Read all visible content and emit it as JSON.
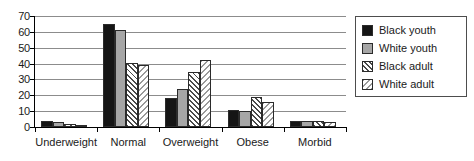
{
  "chart_data": {
    "type": "bar",
    "title": "",
    "subtitle": "",
    "xlabel": "",
    "ylabel": "",
    "categories": [
      "Underweight",
      "Normal",
      "Overweight",
      "Obese",
      "Morbid"
    ],
    "series": [
      {
        "name": "Black youth",
        "color": "#151515",
        "pattern": "solid",
        "values": [
          4,
          65,
          18,
          11,
          4
        ]
      },
      {
        "name": "White youth",
        "color": "#a6a6a6",
        "pattern": "solid",
        "values": [
          3,
          61,
          24,
          10,
          4
        ]
      },
      {
        "name": "Black adult",
        "color": "#4a4a4a",
        "pattern": "hatch-dark",
        "values": [
          2,
          40.5,
          35,
          19,
          4
        ]
      },
      {
        "name": "White adult",
        "color": "#9a9a9a",
        "pattern": "hatch-light",
        "values": [
          1.5,
          39,
          42,
          16,
          3
        ]
      }
    ],
    "ylim": [
      0,
      70
    ],
    "ytick_step": 10,
    "yticks": [
      0,
      10,
      20,
      30,
      40,
      50,
      60,
      70
    ],
    "ytick_labels": [
      "0",
      "10",
      "20",
      "30",
      "40",
      "50",
      "60",
      "70"
    ],
    "grid": true,
    "grid_axis": "y",
    "legend_position": "right",
    "legend_border": true,
    "axis_color": "#000000",
    "grid_color": "#8c8c8c",
    "background": "#ffffff"
  }
}
